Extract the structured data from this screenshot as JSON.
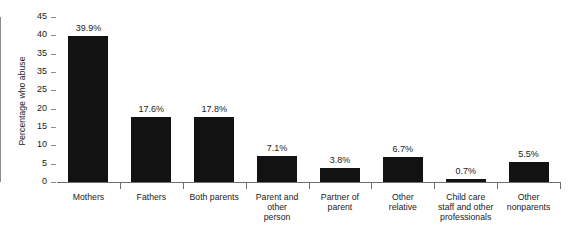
{
  "chart_data": {
    "type": "bar",
    "title": "",
    "xlabel": "",
    "ylabel": "Percentage who abuse",
    "ylim": [
      0,
      45
    ],
    "grid": false,
    "legend": false,
    "categories": [
      "Mothers",
      "Fathers",
      "Both parents",
      "Parent and other person",
      "Partner of parent",
      "Other relative",
      "Child care staff and other professionals",
      "Other nonparents"
    ],
    "values": [
      39.9,
      17.6,
      17.8,
      7.1,
      3.8,
      6.7,
      0.7,
      5.5
    ],
    "data_labels": [
      "39.9%",
      "17.6%",
      "17.8%",
      "7.1%",
      "3.8%",
      "6.7%",
      "0.7%",
      "5.5%"
    ],
    "y_tick_labels": [
      "45",
      "40",
      "35",
      "35",
      "25",
      "20",
      "15",
      "10",
      "5",
      "0"
    ],
    "y_tick_values": [
      45,
      40,
      35,
      30,
      25,
      20,
      15,
      10,
      5,
      0
    ],
    "bar_color": "#121212",
    "axis_color": "#6d6d6d",
    "background_color": "#ffffff"
  },
  "category_label_lines": [
    [
      "Mothers"
    ],
    [
      "Fathers"
    ],
    [
      "Both parents"
    ],
    [
      "Parent and",
      "other",
      "person"
    ],
    [
      "Partner of",
      "parent"
    ],
    [
      "Other",
      "relative"
    ],
    [
      "Child care",
      "staff and other",
      "professionals"
    ],
    [
      "Other",
      "nonparents"
    ]
  ]
}
